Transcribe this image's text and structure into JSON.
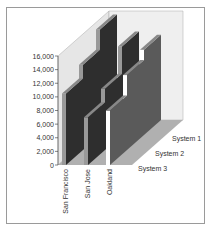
{
  "chart_data": {
    "type": "bar",
    "subtype": "3d-column",
    "title": "",
    "xlabel": "",
    "ylabel": "",
    "categories": [
      "San Francisco",
      "San Jose",
      "Oakland"
    ],
    "series": [
      {
        "name": "System 1",
        "values": [
          15500,
          13000,
          12500
        ]
      },
      {
        "name": "System 2",
        "values": [
          12500,
          9000,
          11000
        ]
      },
      {
        "name": "System 3",
        "values": [
          10500,
          7000,
          8000
        ]
      }
    ],
    "ylim": [
      0,
      16000
    ],
    "yticks": [
      "0",
      "2,000",
      "4,000",
      "6,000",
      "8,000",
      "10,000",
      "12,000",
      "14,000",
      "16,000"
    ],
    "grid": true,
    "legend": "none (series labels on depth axis)",
    "colors": {
      "dark": "#2e2e2e",
      "gray": "#5a5a5a",
      "wall": "#e4e4e4",
      "floor": "#9a9a9a"
    }
  }
}
